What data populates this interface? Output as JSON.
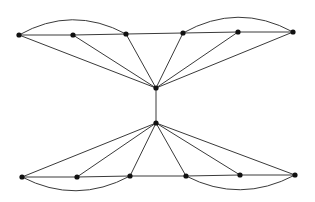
{
  "diagram": {
    "type": "graph",
    "colors": {
      "edge": "#3a3a3a",
      "node": "#111111",
      "background": "#ffffff"
    },
    "node_radius": 2.6,
    "nodes": [
      {
        "id": "t1",
        "x": 19,
        "y": 35
      },
      {
        "id": "t2",
        "x": 73,
        "y": 35
      },
      {
        "id": "t3",
        "x": 126,
        "y": 34
      },
      {
        "id": "t4",
        "x": 183,
        "y": 33
      },
      {
        "id": "t5",
        "x": 238,
        "y": 32
      },
      {
        "id": "t6",
        "x": 293,
        "y": 32
      },
      {
        "id": "hub_top",
        "x": 156,
        "y": 88
      },
      {
        "id": "hub_bottom",
        "x": 156,
        "y": 123
      },
      {
        "id": "b1",
        "x": 22,
        "y": 177
      },
      {
        "id": "b2",
        "x": 77,
        "y": 177
      },
      {
        "id": "b3",
        "x": 130,
        "y": 176
      },
      {
        "id": "b4",
        "x": 186,
        "y": 176
      },
      {
        "id": "b5",
        "x": 240,
        "y": 175
      },
      {
        "id": "b6",
        "x": 295,
        "y": 175
      }
    ],
    "edges": [
      [
        "t1",
        "t2"
      ],
      [
        "t2",
        "t3"
      ],
      [
        "t3",
        "t4"
      ],
      [
        "t4",
        "t5"
      ],
      [
        "t5",
        "t6"
      ],
      [
        "t1",
        "hub_top"
      ],
      [
        "t2",
        "hub_top"
      ],
      [
        "t3",
        "hub_top"
      ],
      [
        "t4",
        "hub_top"
      ],
      [
        "t5",
        "hub_top"
      ],
      [
        "t6",
        "hub_top"
      ],
      [
        "hub_top",
        "hub_bottom"
      ],
      [
        "b1",
        "b2"
      ],
      [
        "b2",
        "b3"
      ],
      [
        "b3",
        "b4"
      ],
      [
        "b4",
        "b5"
      ],
      [
        "b5",
        "b6"
      ],
      [
        "b1",
        "hub_bottom"
      ],
      [
        "b2",
        "hub_bottom"
      ],
      [
        "b3",
        "hub_bottom"
      ],
      [
        "b4",
        "hub_bottom"
      ],
      [
        "b5",
        "hub_bottom"
      ],
      [
        "b6",
        "hub_bottom"
      ]
    ],
    "arcs": [
      {
        "from": "t1",
        "to": "t3",
        "cx": 72,
        "cy": 5,
        "side": "above"
      },
      {
        "from": "t4",
        "to": "t6",
        "cx": 238,
        "cy": 2,
        "side": "above"
      },
      {
        "from": "b1",
        "to": "b3",
        "cx": 76,
        "cy": 205,
        "side": "below"
      },
      {
        "from": "b4",
        "to": "b6",
        "cx": 240,
        "cy": 204,
        "side": "below"
      }
    ]
  }
}
